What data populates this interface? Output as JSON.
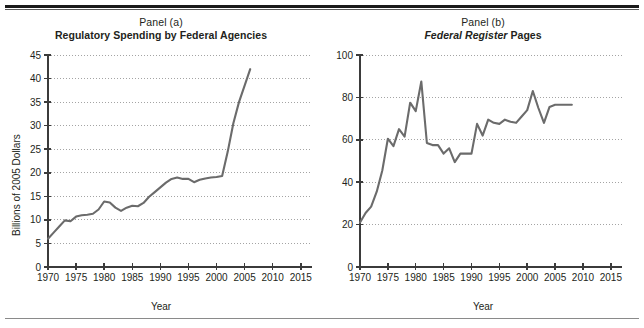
{
  "figure": {
    "background": "#ffffff",
    "line_color": "#6b6b6b",
    "axis_color": "#3b3b3b",
    "grid_color": "#9a9a9a",
    "rule_top_color": "#1a1a1a",
    "rule_bottom_color": "#8a8a8a"
  },
  "panel_a": {
    "panel_label": "Panel (a)",
    "title": "Regulatory Spending by Federal Agencies",
    "ylabel": "Billions of 2005 Dollars",
    "xlabel": "Year",
    "ytick_labels": [
      "0",
      "5",
      "10",
      "15",
      "20",
      "25",
      "30",
      "35",
      "40",
      "45"
    ],
    "xtick_labels": [
      "1970",
      "1975",
      "1980",
      "1985",
      "1990",
      "1995",
      "2000",
      "2005",
      "2010",
      "2015"
    ]
  },
  "panel_b": {
    "panel_label": "Panel (b)",
    "title_italic": "Federal Register",
    "title_rest": " Pages",
    "ylabel": "Thousands of Pages",
    "xlabel": "Year",
    "ytick_labels": [
      "0",
      "20",
      "40",
      "60",
      "80",
      "100"
    ],
    "xtick_labels": [
      "1970",
      "1975",
      "1980",
      "1985",
      "1990",
      "1995",
      "2000",
      "2005",
      "2010",
      "2015"
    ]
  },
  "chart_data": [
    {
      "type": "line",
      "id": "panel-a",
      "title": "Regulatory Spending by Federal Agencies",
      "subtitle": "Panel (a)",
      "xlabel": "Year",
      "ylabel": "Billions of 2005 Dollars",
      "xlim": [
        1970,
        2017
      ],
      "ylim": [
        0,
        45
      ],
      "ytick_interval": 5,
      "xtick_interval": 5,
      "grid": "horizontal-dotted",
      "legend": "none",
      "x": [
        1970,
        1971,
        1972,
        1973,
        1974,
        1975,
        1976,
        1977,
        1978,
        1979,
        1980,
        1981,
        1982,
        1983,
        1984,
        1985,
        1986,
        1987,
        1988,
        1989,
        1990,
        1991,
        1992,
        1993,
        1994,
        1995,
        1996,
        1997,
        1998,
        1999,
        2000,
        2001,
        2002,
        2003,
        2004,
        2005,
        2006
      ],
      "values": [
        6.0,
        7.3,
        8.6,
        9.9,
        9.7,
        10.7,
        11.0,
        11.1,
        11.3,
        12.2,
        13.9,
        13.7,
        12.6,
        11.9,
        12.6,
        13.0,
        12.9,
        13.6,
        14.9,
        15.9,
        16.9,
        17.9,
        18.7,
        19.0,
        18.7,
        18.7,
        18.0,
        18.5,
        18.8,
        19.0,
        19.1,
        19.3,
        24.5,
        30.5,
        35.0,
        38.5,
        42.0
      ]
    },
    {
      "type": "line",
      "id": "panel-b",
      "title": "Federal Register Pages",
      "subtitle": "Panel (b)",
      "xlabel": "Year",
      "ylabel": "Thousands of Pages",
      "xlim": [
        1970,
        2017
      ],
      "ylim": [
        0,
        100
      ],
      "ytick_interval": 20,
      "xtick_interval": 5,
      "grid": "horizontal-dotted",
      "legend": "none",
      "x": [
        1970,
        1971,
        1972,
        1973,
        1974,
        1975,
        1976,
        1977,
        1978,
        1979,
        1980,
        1981,
        1982,
        1983,
        1984,
        1985,
        1986,
        1987,
        1988,
        1989,
        1990,
        1991,
        1992,
        1993,
        1994,
        1995,
        1996,
        1997,
        1998,
        1999,
        2000,
        2001,
        2002,
        2003,
        2004,
        2005,
        2006,
        2007,
        2008
      ],
      "values": [
        21.0,
        25.5,
        28.5,
        35.5,
        45.5,
        60.5,
        57.0,
        65.0,
        61.5,
        77.5,
        73.5,
        87.5,
        58.5,
        57.5,
        57.5,
        53.5,
        56.0,
        49.5,
        53.5,
        53.5,
        53.5,
        67.5,
        62.0,
        69.5,
        68.0,
        67.5,
        69.5,
        68.5,
        68.0,
        71.0,
        74.0,
        83.0,
        75.0,
        68.0,
        75.5,
        76.5,
        76.5,
        76.5,
        76.5
      ]
    }
  ]
}
